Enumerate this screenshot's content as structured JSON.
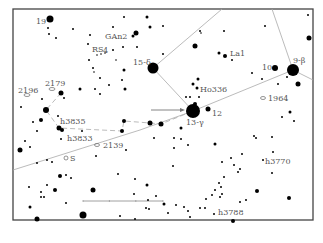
{
  "chart": {
    "frame": {
      "x": 13,
      "y": 9,
      "w": 300,
      "h": 211,
      "stroke": "#444444"
    },
    "colors": {
      "star": "#000000",
      "line": "#aaaaaa",
      "label": "#555555",
      "arrow": "#777777"
    },
    "labels": [
      {
        "text": "19",
        "x": 36,
        "y": 24
      },
      {
        "text": "GAn2",
        "x": 105,
        "y": 39
      },
      {
        "text": "RS",
        "x": 92,
        "y": 52
      },
      {
        "text": "4",
        "x": 103,
        "y": 53,
        "small": true
      },
      {
        "text": "15-δ",
        "x": 133,
        "y": 65
      },
      {
        "text": "La1",
        "x": 230,
        "y": 56
      },
      {
        "text": "10",
        "x": 262,
        "y": 70
      },
      {
        "text": "9-β",
        "x": 293,
        "y": 63
      },
      {
        "text": "Ho336",
        "x": 200,
        "y": 92
      },
      {
        "text": "1964",
        "x": 268,
        "y": 101
      },
      {
        "text": "2196",
        "x": 18,
        "y": 93
      },
      {
        "text": "2179",
        "x": 45,
        "y": 86
      },
      {
        "text": "12",
        "x": 212,
        "y": 116
      },
      {
        "text": "13-γ",
        "x": 186,
        "y": 125
      },
      {
        "text": "h3835",
        "x": 60,
        "y": 124
      },
      {
        "text": "h3833",
        "x": 67,
        "y": 141
      },
      {
        "text": "2139",
        "x": 103,
        "y": 148
      },
      {
        "text": "S",
        "x": 70,
        "y": 161
      },
      {
        "text": "h3770",
        "x": 265,
        "y": 164
      },
      {
        "text": "h3788",
        "x": 218,
        "y": 215
      }
    ],
    "stars": [
      {
        "x": 50,
        "y": 19,
        "r": 3.5
      },
      {
        "x": 48,
        "y": 28,
        "r": 1
      },
      {
        "x": 49,
        "y": 34,
        "r": 1
      },
      {
        "x": 56,
        "y": 38,
        "r": 1
      },
      {
        "x": 73,
        "y": 29,
        "r": 1
      },
      {
        "x": 90,
        "y": 35,
        "r": 1
      },
      {
        "x": 88,
        "y": 44,
        "r": 1
      },
      {
        "x": 113,
        "y": 27,
        "r": 1
      },
      {
        "x": 124,
        "y": 17,
        "r": 1
      },
      {
        "x": 147,
        "y": 17,
        "r": 1.5
      },
      {
        "x": 150,
        "y": 27,
        "r": 1.5
      },
      {
        "x": 136,
        "y": 33,
        "r": 2.5
      },
      {
        "x": 133,
        "y": 36,
        "r": 1.5
      },
      {
        "x": 113,
        "y": 50,
        "r": 1
      },
      {
        "x": 123,
        "y": 47,
        "r": 1
      },
      {
        "x": 137,
        "y": 47,
        "r": 1
      },
      {
        "x": 97,
        "y": 55,
        "r": 0.8
      },
      {
        "x": 101,
        "y": 54,
        "r": 0.8
      },
      {
        "x": 105,
        "y": 53,
        "r": 0.8
      },
      {
        "x": 89,
        "y": 60,
        "r": 1
      },
      {
        "x": 116,
        "y": 60,
        "r": 0.8
      },
      {
        "x": 93,
        "y": 68,
        "r": 1
      },
      {
        "x": 94,
        "y": 72,
        "r": 0.8
      },
      {
        "x": 100,
        "y": 78,
        "r": 1
      },
      {
        "x": 124,
        "y": 70,
        "r": 1.5
      },
      {
        "x": 109,
        "y": 85,
        "r": 1
      },
      {
        "x": 122,
        "y": 80,
        "r": 1
      },
      {
        "x": 125,
        "y": 89,
        "r": 1.5
      },
      {
        "x": 153,
        "y": 68,
        "r": 5.5
      },
      {
        "x": 80,
        "y": 89,
        "r": 1.5
      },
      {
        "x": 95,
        "y": 89,
        "r": 1
      },
      {
        "x": 100,
        "y": 94,
        "r": 1
      },
      {
        "x": 61,
        "y": 93,
        "r": 2.5
      },
      {
        "x": 64,
        "y": 98,
        "r": 1
      },
      {
        "x": 42,
        "y": 99,
        "r": 1
      },
      {
        "x": 21,
        "y": 107,
        "r": 1
      },
      {
        "x": 46,
        "y": 110,
        "r": 3
      },
      {
        "x": 58,
        "y": 116,
        "r": 1
      },
      {
        "x": 41,
        "y": 120,
        "r": 2
      },
      {
        "x": 33,
        "y": 122,
        "r": 1
      },
      {
        "x": 59,
        "y": 128,
        "r": 2.5
      },
      {
        "x": 62,
        "y": 130,
        "r": 2
      },
      {
        "x": 37,
        "y": 131,
        "r": 1
      },
      {
        "x": 61,
        "y": 139,
        "r": 1
      },
      {
        "x": 25,
        "y": 141,
        "r": 1
      },
      {
        "x": 30,
        "y": 147,
        "r": 1
      },
      {
        "x": 20,
        "y": 150,
        "r": 2.5
      },
      {
        "x": 37,
        "y": 163,
        "r": 1
      },
      {
        "x": 47,
        "y": 160,
        "r": 1
      },
      {
        "x": 52,
        "y": 162,
        "r": 1
      },
      {
        "x": 82,
        "y": 131,
        "r": 1
      },
      {
        "x": 124,
        "y": 121,
        "r": 2
      },
      {
        "x": 122,
        "y": 131,
        "r": 2
      },
      {
        "x": 150,
        "y": 123,
        "r": 2.5
      },
      {
        "x": 161,
        "y": 124,
        "r": 2.5
      },
      {
        "x": 96,
        "y": 156,
        "r": 1
      },
      {
        "x": 126,
        "y": 150,
        "r": 1
      },
      {
        "x": 174,
        "y": 138,
        "r": 1
      },
      {
        "x": 154,
        "y": 138,
        "r": 1
      },
      {
        "x": 174,
        "y": 148,
        "r": 1
      },
      {
        "x": 181,
        "y": 139,
        "r": 1
      },
      {
        "x": 188,
        "y": 145,
        "r": 1
      },
      {
        "x": 193,
        "y": 111,
        "r": 7
      },
      {
        "x": 195,
        "y": 104,
        "r": 2
      },
      {
        "x": 208,
        "y": 109,
        "r": 2.5
      },
      {
        "x": 193,
        "y": 84,
        "r": 1.5
      },
      {
        "x": 198,
        "y": 79,
        "r": 1.5
      },
      {
        "x": 197,
        "y": 88,
        "r": 1.5
      },
      {
        "x": 199,
        "y": 97,
        "r": 1
      },
      {
        "x": 186,
        "y": 97,
        "r": 1
      },
      {
        "x": 190,
        "y": 97,
        "r": 1
      },
      {
        "x": 196,
        "y": 3,
        "r": 0
      },
      {
        "x": 163,
        "y": 26,
        "r": 1
      },
      {
        "x": 165,
        "y": 4,
        "r": 0
      },
      {
        "x": 195,
        "y": 46,
        "r": 2.5
      },
      {
        "x": 163,
        "y": 54,
        "r": 1
      },
      {
        "x": 219,
        "y": 53,
        "r": 1.5
      },
      {
        "x": 225,
        "y": 56,
        "r": 2
      },
      {
        "x": 232,
        "y": 60,
        "r": 1
      },
      {
        "x": 224,
        "y": 31,
        "r": 1
      },
      {
        "x": 200,
        "y": 31,
        "r": 1
      },
      {
        "x": 201,
        "y": 33,
        "r": 0.8
      },
      {
        "x": 265,
        "y": 26,
        "r": 1
      },
      {
        "x": 308,
        "y": 15,
        "r": 1
      },
      {
        "x": 309,
        "y": 38,
        "r": 2.5
      },
      {
        "x": 275,
        "y": 68,
        "r": 3
      },
      {
        "x": 293,
        "y": 70,
        "r": 6
      },
      {
        "x": 298,
        "y": 84,
        "r": 2.5
      },
      {
        "x": 287,
        "y": 77,
        "r": 1
      },
      {
        "x": 252,
        "y": 73,
        "r": 1
      },
      {
        "x": 262,
        "y": 79,
        "r": 1
      },
      {
        "x": 278,
        "y": 84,
        "r": 1
      },
      {
        "x": 290,
        "y": 112,
        "r": 1.5
      },
      {
        "x": 282,
        "y": 117,
        "r": 1
      },
      {
        "x": 294,
        "y": 121,
        "r": 1
      },
      {
        "x": 181,
        "y": 128,
        "r": 1.5
      },
      {
        "x": 215,
        "y": 144,
        "r": 1.5
      },
      {
        "x": 254,
        "y": 136,
        "r": 1
      },
      {
        "x": 256,
        "y": 138,
        "r": 1
      },
      {
        "x": 272,
        "y": 137,
        "r": 1
      },
      {
        "x": 273,
        "y": 152,
        "r": 1
      },
      {
        "x": 263,
        "y": 160,
        "r": 1
      },
      {
        "x": 272,
        "y": 173,
        "r": 1
      },
      {
        "x": 231,
        "y": 158,
        "r": 1
      },
      {
        "x": 242,
        "y": 154,
        "r": 1
      },
      {
        "x": 222,
        "y": 162,
        "r": 1
      },
      {
        "x": 234,
        "y": 165,
        "r": 1
      },
      {
        "x": 240,
        "y": 169,
        "r": 1
      },
      {
        "x": 238,
        "y": 172,
        "r": 1
      },
      {
        "x": 173,
        "y": 166,
        "r": 1
      },
      {
        "x": 224,
        "y": 177,
        "r": 1
      },
      {
        "x": 219,
        "y": 183,
        "r": 1
      },
      {
        "x": 221,
        "y": 187,
        "r": 1
      },
      {
        "x": 215,
        "y": 190,
        "r": 1
      },
      {
        "x": 212,
        "y": 195,
        "r": 1
      },
      {
        "x": 222,
        "y": 194,
        "r": 1
      },
      {
        "x": 220,
        "y": 197,
        "r": 1
      },
      {
        "x": 257,
        "y": 191,
        "r": 2
      },
      {
        "x": 289,
        "y": 198,
        "r": 2
      },
      {
        "x": 240,
        "y": 202,
        "r": 1
      },
      {
        "x": 246,
        "y": 200,
        "r": 1
      },
      {
        "x": 206,
        "y": 199,
        "r": 1
      },
      {
        "x": 205,
        "y": 208,
        "r": 1
      },
      {
        "x": 200,
        "y": 208,
        "r": 1
      },
      {
        "x": 184,
        "y": 207,
        "r": 1
      },
      {
        "x": 188,
        "y": 211,
        "r": 1
      },
      {
        "x": 190,
        "y": 217,
        "r": 1
      },
      {
        "x": 176,
        "y": 205,
        "r": 1
      },
      {
        "x": 168,
        "y": 213,
        "r": 1
      },
      {
        "x": 214,
        "y": 214,
        "r": 1
      },
      {
        "x": 233,
        "y": 221,
        "r": 2
      },
      {
        "x": 60,
        "y": 176,
        "r": 2
      },
      {
        "x": 66,
        "y": 175,
        "r": 1
      },
      {
        "x": 71,
        "y": 178,
        "r": 1
      },
      {
        "x": 93,
        "y": 190,
        "r": 2.5
      },
      {
        "x": 118,
        "y": 174,
        "r": 1
      },
      {
        "x": 135,
        "y": 179,
        "r": 1
      },
      {
        "x": 147,
        "y": 185,
        "r": 1.5
      },
      {
        "x": 134,
        "y": 194,
        "r": 1
      },
      {
        "x": 156,
        "y": 196,
        "r": 1
      },
      {
        "x": 148,
        "y": 200,
        "r": 1
      },
      {
        "x": 29,
        "y": 187,
        "r": 1
      },
      {
        "x": 41,
        "y": 192,
        "r": 1
      },
      {
        "x": 47,
        "y": 185,
        "r": 1
      },
      {
        "x": 55,
        "y": 190,
        "r": 2
      },
      {
        "x": 41,
        "y": 197,
        "r": 1
      },
      {
        "x": 44,
        "y": 197,
        "r": 1
      },
      {
        "x": 66,
        "y": 203,
        "r": 1
      },
      {
        "x": 30,
        "y": 207,
        "r": 1.5
      },
      {
        "x": 37,
        "y": 219,
        "r": 2.5
      },
      {
        "x": 83,
        "y": 215,
        "r": 3.5
      },
      {
        "x": 120,
        "y": 216,
        "r": 1
      },
      {
        "x": 135,
        "y": 219,
        "r": 1
      },
      {
        "x": 164,
        "y": 204,
        "r": 1.5
      },
      {
        "x": 149,
        "y": 209,
        "r": 1
      },
      {
        "x": 146,
        "y": 208,
        "r": 1
      }
    ],
    "open_symbols": [
      {
        "x": 27,
        "y": 95,
        "rx": 3,
        "ry": 1.5
      },
      {
        "x": 52,
        "y": 89,
        "rx": 3,
        "ry": 1.5
      },
      {
        "x": 263,
        "y": 98,
        "rx": 2.5,
        "ry": 1.5
      },
      {
        "x": 97,
        "y": 145,
        "rx": 2.5,
        "ry": 1.5
      },
      {
        "x": 66,
        "y": 158,
        "rx": 2,
        "ry": 2
      }
    ],
    "constellation_lines": [
      {
        "x1": 153,
        "y1": 68,
        "x2": 222,
        "y2": 9
      },
      {
        "x1": 153,
        "y1": 68,
        "x2": 193,
        "y2": 111
      },
      {
        "x1": 193,
        "y1": 111,
        "x2": 293,
        "y2": 70
      },
      {
        "x1": 293,
        "y1": 70,
        "x2": 272,
        "y2": 9
      },
      {
        "x1": 293,
        "y1": 70,
        "x2": 313,
        "y2": 80
      },
      {
        "x1": 193,
        "y1": 111,
        "x2": 140,
        "y2": 130
      },
      {
        "x1": 140,
        "y1": 130,
        "x2": 13,
        "y2": 170
      }
    ],
    "dashed_lines": [
      {
        "points": "61,93 46,110 59,128 122,131 124,121 150,123 161,124 193,111"
      }
    ],
    "scale_bar": {
      "x1": 83,
      "y1": 201,
      "x2": 163,
      "y2": 201
    },
    "arrow": {
      "x1": 151,
      "y1": 110,
      "x2": 185,
      "y2": 110
    }
  }
}
